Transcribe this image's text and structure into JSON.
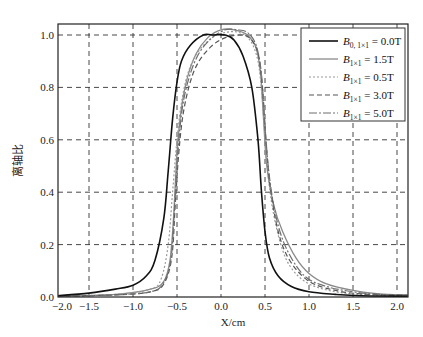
{
  "chart_data": {
    "type": "line",
    "title": "",
    "xlabel": "X/cm",
    "ylabel": "离轴比",
    "xlim": [
      -1.85,
      2.12
    ],
    "ylim": [
      0.0,
      1.04
    ],
    "grid": true,
    "grid_style": "dashed",
    "legend_position": "upper right",
    "xticks": [
      -2.0,
      -1.5,
      -1.0,
      -0.5,
      0.0,
      0.5,
      1.0,
      1.5,
      2.0
    ],
    "xtick_labels": [
      "−2.0",
      "−1.5",
      "−1.0",
      "−0.5",
      "0.0",
      "0.5",
      "1.0",
      "1.5",
      "2.0"
    ],
    "yticks": [
      0.0,
      0.2,
      0.4,
      0.6,
      0.8,
      1.0
    ],
    "ytick_labels": [
      "0.0",
      "0.2",
      "0.4",
      "0.6",
      "0.8",
      "1.0"
    ],
    "series": [
      {
        "name": "B0, 1×1 = 0.0T",
        "legend_main": "B",
        "legend_sub": "0, 1×1",
        "legend_rest": " = 0.0T",
        "color": "#111111",
        "width": 1.6,
        "dash": "",
        "x": [
          -1.85,
          -1.5,
          -1.2,
          -1.0,
          -0.85,
          -0.75,
          -0.65,
          -0.6,
          -0.55,
          -0.5,
          -0.45,
          -0.35,
          -0.2,
          -0.1,
          0.05,
          0.15,
          0.25,
          0.35,
          0.42,
          0.46,
          0.5,
          0.55,
          0.65,
          0.8,
          1.0,
          1.3,
          1.6,
          2.12
        ],
        "y": [
          0.005,
          0.015,
          0.03,
          0.045,
          0.08,
          0.14,
          0.3,
          0.48,
          0.68,
          0.82,
          0.9,
          0.96,
          1.0,
          1.0,
          1.0,
          0.98,
          0.92,
          0.8,
          0.6,
          0.4,
          0.25,
          0.15,
          0.08,
          0.04,
          0.02,
          0.01,
          0.005,
          0.003
        ]
      },
      {
        "name": "B1×1 = 1.5T",
        "legend_main": "B",
        "legend_sub": "1×1",
        "legend_rest": " = 1.5T",
        "color": "#8a8a8a",
        "width": 1.3,
        "dash": "",
        "x": [
          -1.85,
          -1.2,
          -0.8,
          -0.65,
          -0.58,
          -0.54,
          -0.5,
          -0.45,
          -0.38,
          -0.28,
          -0.15,
          0.0,
          0.15,
          0.3,
          0.4,
          0.45,
          0.48,
          0.52,
          0.6,
          0.7,
          0.85,
          1.0,
          1.2,
          1.5,
          1.8,
          2.12
        ],
        "y": [
          0.003,
          0.01,
          0.03,
          0.06,
          0.14,
          0.3,
          0.55,
          0.72,
          0.84,
          0.93,
          0.99,
          1.02,
          1.02,
          1.0,
          0.95,
          0.85,
          0.7,
          0.5,
          0.35,
          0.25,
          0.15,
          0.09,
          0.05,
          0.025,
          0.012,
          0.008
        ]
      },
      {
        "name": "B1×1 = 0.5T",
        "legend_main": "B",
        "legend_sub": "1×1",
        "legend_rest": " = 0.5T",
        "color": "#9a9a9a",
        "width": 1.2,
        "dash": "2,2",
        "x": [
          -1.85,
          -1.2,
          -0.8,
          -0.68,
          -0.6,
          -0.55,
          -0.5,
          -0.44,
          -0.36,
          -0.25,
          -0.1,
          0.05,
          0.2,
          0.33,
          0.42,
          0.47,
          0.52,
          0.58,
          0.68,
          0.8,
          1.0,
          1.3,
          1.6,
          2.12
        ],
        "y": [
          0.003,
          0.01,
          0.03,
          0.07,
          0.2,
          0.4,
          0.6,
          0.76,
          0.87,
          0.94,
          0.99,
          1.01,
          1.01,
          0.98,
          0.9,
          0.75,
          0.52,
          0.35,
          0.2,
          0.11,
          0.05,
          0.02,
          0.01,
          0.005
        ]
      },
      {
        "name": "B1×1 = 3.0T",
        "legend_main": "B",
        "legend_sub": "1×1",
        "legend_rest": " = 3.0T",
        "color": "#555555",
        "width": 1.2,
        "dash": "5,3",
        "x": [
          -1.85,
          -1.2,
          -0.8,
          -0.65,
          -0.56,
          -0.52,
          -0.48,
          -0.43,
          -0.35,
          -0.25,
          -0.1,
          0.05,
          0.2,
          0.32,
          0.42,
          0.47,
          0.51,
          0.56,
          0.65,
          0.78,
          1.0,
          1.3,
          1.6,
          2.12
        ],
        "y": [
          0.003,
          0.008,
          0.02,
          0.05,
          0.15,
          0.35,
          0.55,
          0.7,
          0.82,
          0.9,
          0.96,
          0.99,
          1.0,
          0.99,
          0.93,
          0.8,
          0.6,
          0.42,
          0.25,
          0.14,
          0.06,
          0.025,
          0.012,
          0.006
        ]
      },
      {
        "name": "B1×1 = 5.0T",
        "legend_main": "B",
        "legend_sub": "1×1",
        "legend_rest": " = 5.0T",
        "color": "#6e6e6e",
        "width": 1.2,
        "dash": "8,2,2,2",
        "x": [
          -1.85,
          -1.2,
          -0.8,
          -0.66,
          -0.57,
          -0.53,
          -0.49,
          -0.44,
          -0.36,
          -0.25,
          -0.1,
          0.05,
          0.18,
          0.3,
          0.4,
          0.46,
          0.5,
          0.55,
          0.63,
          0.75,
          0.95,
          1.2,
          1.5,
          1.8,
          2.12
        ],
        "y": [
          0.003,
          0.008,
          0.02,
          0.05,
          0.14,
          0.33,
          0.55,
          0.72,
          0.84,
          0.93,
          0.99,
          1.02,
          1.02,
          1.01,
          0.96,
          0.85,
          0.65,
          0.46,
          0.3,
          0.18,
          0.08,
          0.04,
          0.02,
          0.01,
          0.006
        ]
      }
    ]
  },
  "caption": "（图注文字被截断）"
}
